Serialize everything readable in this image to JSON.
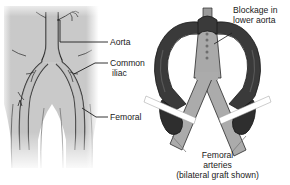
{
  "figure": {
    "panels": [
      {
        "name": "normal-anatomy",
        "caption": ""
      },
      {
        "name": "bypass-graft",
        "caption": ""
      }
    ]
  },
  "labels": {
    "aorta": "Aorta",
    "common_iliac_line1": "Common",
    "common_iliac_line2": "iliac",
    "femoral": "Femoral",
    "blockage_line1": "Blockage in",
    "blockage_line2": "lower aorta",
    "caption_line1": "Femoral",
    "caption_line2": "arteries",
    "caption_line3": "(bilateral graft shown)"
  },
  "colors": {
    "body_fill": "#c9c9c9",
    "body_fill_light": "#d6d6d6",
    "vessel_fill": "#b8b8b8",
    "graft_dark": "#3a3a3a",
    "graft_dark_shade": "#2a2a2a",
    "artery_grey": "#a8a8a8",
    "outline": "#1e1e1e",
    "text": "#1a1a1a",
    "background": "#ffffff",
    "cut_white": "#ffffff"
  }
}
